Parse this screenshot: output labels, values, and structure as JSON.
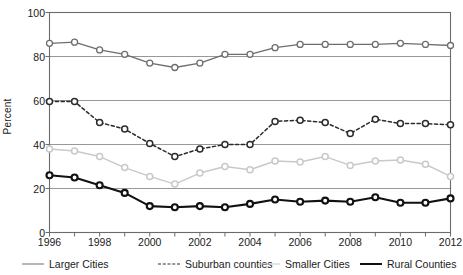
{
  "chart_data": {
    "type": "line",
    "title": "",
    "xlabel": "",
    "ylabel": "Percent",
    "xlim": [
      1996,
      2012
    ],
    "ylim": [
      0,
      100
    ],
    "grid": true,
    "legend_position": "bottom",
    "x": [
      1996,
      1997,
      1998,
      1999,
      2000,
      2001,
      2002,
      2003,
      2004,
      2005,
      2006,
      2007,
      2008,
      2009,
      2010,
      2011,
      2012
    ],
    "x_tick_labels": [
      "1996",
      "1998",
      "2000",
      "2002",
      "2004",
      "2006",
      "2008",
      "2010",
      "2012"
    ],
    "x_tick_values": [
      1996,
      1998,
      2000,
      2002,
      2004,
      2006,
      2008,
      2010,
      2012
    ],
    "y_tick_labels": [
      "0",
      "20",
      "40",
      "60",
      "80",
      "100"
    ],
    "y_tick_values": [
      0,
      20,
      40,
      60,
      80,
      100
    ],
    "series": [
      {
        "name": "Larger Cities",
        "color": "#6e6e6e",
        "style": "solid",
        "width": 1.3,
        "marker": "open-circle",
        "values": [
          86,
          86.5,
          83,
          81,
          77,
          75,
          77,
          81,
          81,
          84,
          85.5,
          85.5,
          85.5,
          85.5,
          86,
          85.5,
          85
        ]
      },
      {
        "name": "Suburban counties",
        "color": "#2b2b2b",
        "style": "dashed",
        "width": 1.5,
        "marker": "open-circle",
        "values": [
          59.5,
          59.5,
          50,
          47,
          40.5,
          34.5,
          38,
          40,
          40,
          50.5,
          51,
          50,
          45,
          51.5,
          49.5,
          49.5,
          49
        ]
      },
      {
        "name": "Smaller Cities",
        "color": "#c9c9c9",
        "style": "solid",
        "width": 1.5,
        "marker": "open-circle",
        "values": [
          38,
          37,
          34.5,
          29.5,
          25.5,
          22,
          27,
          30,
          28.5,
          32.5,
          32,
          34.5,
          30.5,
          32.5,
          33,
          31,
          25.5
        ]
      },
      {
        "name": "Rural Counties",
        "color": "#111111",
        "style": "solid",
        "width": 2.1,
        "marker": "open-circle",
        "values": [
          26,
          25,
          21.5,
          18,
          12,
          11.5,
          12,
          11.5,
          13,
          15,
          14,
          14.5,
          14,
          16,
          13.5,
          13.5,
          15.5
        ]
      }
    ]
  },
  "legend": {
    "items": [
      {
        "label": "Larger Cities"
      },
      {
        "label": "Suburban counties"
      },
      {
        "label": "Smaller Cities"
      },
      {
        "label": "Rural Counties"
      }
    ]
  }
}
